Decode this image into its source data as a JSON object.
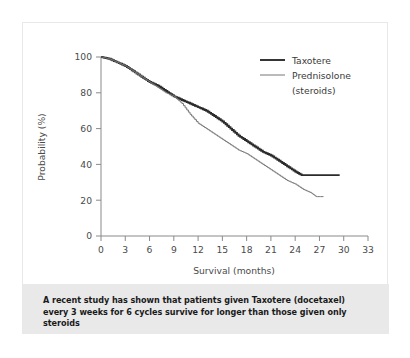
{
  "chart_data": {
    "type": "line",
    "title": "",
    "xlabel": "Survival (months)",
    "ylabel": "Probability (%)",
    "xlim": [
      0,
      33
    ],
    "ylim": [
      0,
      100
    ],
    "xticks": [
      "0",
      "3",
      "6",
      "9",
      "12",
      "15",
      "18",
      "21",
      "24",
      "27",
      "30",
      "33"
    ],
    "yticks": [
      "0",
      "20",
      "40",
      "60",
      "80",
      "100"
    ],
    "grid": false,
    "legend_position": "top-right",
    "series": [
      {
        "name": "Taxotere",
        "color": "#2b2b2b",
        "line_width": 1.9,
        "x": [
          0,
          1,
          2,
          3,
          4,
          5,
          6,
          7,
          8,
          9,
          10,
          11,
          12,
          13,
          14,
          15,
          16,
          17,
          18,
          19,
          20,
          21,
          22,
          23,
          24,
          24.8,
          26,
          27,
          28,
          29.5
        ],
        "values": [
          100,
          99,
          97,
          95,
          92,
          89,
          86,
          84,
          81,
          78,
          76,
          74,
          72,
          70,
          67,
          64,
          60,
          56,
          53,
          50,
          47,
          45,
          42,
          39,
          36,
          34,
          34,
          34,
          34,
          34
        ]
      },
      {
        "name": "Prednisolone (steroids)",
        "color": "#767676",
        "line_width": 1.0,
        "x": [
          0,
          1,
          2,
          3,
          4,
          5,
          6,
          7,
          8,
          9,
          10,
          11,
          12,
          13,
          14,
          15,
          16,
          17,
          18,
          19,
          20,
          21,
          22,
          23,
          24,
          25,
          26,
          26.6,
          27.5
        ],
        "values": [
          100,
          99,
          97,
          95,
          92,
          89,
          86,
          83,
          80,
          78,
          74,
          68,
          63,
          60,
          57,
          54,
          51,
          48,
          46,
          43,
          40,
          37,
          34,
          31,
          29,
          26,
          24,
          22,
          22
        ]
      }
    ],
    "legend": [
      {
        "label": "Taxotere"
      },
      {
        "label": "Prednisolone"
      },
      {
        "label": "(steroids)"
      }
    ]
  },
  "caption": {
    "text": "A recent study has shown that patients given Taxotere (docetaxel) every 3 weeks for 6 cycles survive for longer than those given only steroids"
  }
}
